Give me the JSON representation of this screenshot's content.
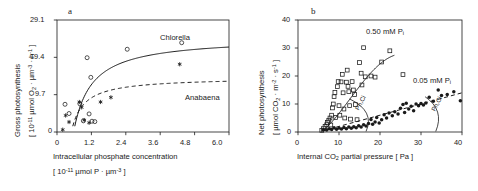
{
  "figure": {
    "background": "#ffffff",
    "ink": "#1a1a1a"
  },
  "panel_a": {
    "letter": "a",
    "xlabel_line1": "Intracellular phosphate concentration",
    "xlabel_line2_pre": "[ 10",
    "xlabel_line2_sup": "-11",
    "xlabel_line2_mid": " µmol P · µm",
    "xlabel_line2_sup2": "-3",
    "xlabel_line2_post": " ]",
    "ylabel_line1": "Gross photosynthesis",
    "ylabel_line2_pre": "[ 10",
    "ylabel_line2_sup": "-11",
    "ylabel_line2_mid": " µmol O",
    "ylabel_line2_sub": "2",
    "ylabel_line2_mid2": " · µm",
    "ylabel_line2_sup2": "-3",
    "ylabel_line2_mid3": " · h",
    "ylabel_line2_sup3": "-1",
    "ylabel_line2_post": " ]",
    "xticks": [
      "0",
      "1.2",
      "2.4",
      "3.6",
      "4.8",
      "6.0"
    ],
    "yticks": [
      "0",
      "9.7",
      "19.4",
      "29.1"
    ],
    "series_labels": {
      "chlorella": "Chlorella",
      "anabaena": "Anabaena"
    }
  },
  "panel_b": {
    "letter": "b",
    "xlabel": "Internal CO",
    "xlabel_sub": "2",
    "xlabel_post": " partial pressure  [ Pa ]",
    "ylabel_line1": "Net  photosynthesis",
    "ylabel_line2_pre": "[ µmol CO",
    "ylabel_line2_sub": "2",
    "ylabel_line2_mid": " · m",
    "ylabel_line2_sup": "-2",
    "ylabel_line2_mid2": " · s",
    "ylabel_line2_sup2": "-1",
    "ylabel_line2_post": " ]",
    "xticks": [
      "0",
      "10",
      "20",
      "30",
      "40"
    ],
    "yticks": [
      "0",
      "10",
      "20",
      "30",
      "40"
    ],
    "curve_labels": {
      "high_pi_pre": "0.50 mM P",
      "high_pi_sub": "i",
      "low_pi_pre": "0.05 mM P",
      "low_pi_sub": "i",
      "pnci_left": "Pn,Ci",
      "pnci_right": "Pn,Ci"
    }
  },
  "chart_data": [
    {
      "type": "scatter",
      "panel": "a",
      "title": "a",
      "xlabel": "Intracellular phosphate concentration [ 10^-11 umol P / um^3 ]",
      "ylabel": "Gross photosynthesis [ 10^-11 umol O2 / um^3 / h ]",
      "xlim": [
        0,
        6.0
      ],
      "ylim": [
        0,
        29.1
      ],
      "xticks": [
        0,
        1.2,
        2.4,
        3.6,
        4.8,
        6.0
      ],
      "yticks": [
        0,
        9.7,
        19.4,
        29.1
      ],
      "grid": false,
      "legend_position": "inline-annotation",
      "series": [
        {
          "name": "Chlorella",
          "marker": "open-circle",
          "line": "solid",
          "points": [
            [
              0.28,
              7.2
            ],
            [
              0.42,
              4.8
            ],
            [
              0.8,
              7.3
            ],
            [
              0.92,
              2.9
            ],
            [
              1.05,
              19.3
            ],
            [
              1.12,
              4.7
            ],
            [
              1.18,
              14.2
            ],
            [
              1.22,
              2.8
            ],
            [
              1.32,
              2.7
            ],
            [
              2.45,
              21.5
            ],
            [
              4.35,
              23.2
            ]
          ],
          "fit_curve": {
            "model": "rectangular-hyperbola-shifted",
            "x_start": 0.62,
            "vmax": 24.6,
            "km": 0.62,
            "x0": 0.58
          }
        },
        {
          "name": "Anabaena",
          "marker": "asterisk",
          "line": "dashed",
          "points": [
            [
              0.2,
              0.6
            ],
            [
              0.3,
              4.3
            ],
            [
              0.42,
              2.6
            ],
            [
              0.78,
              7.8
            ],
            [
              0.86,
              6.4
            ],
            [
              0.95,
              3.1
            ],
            [
              1.12,
              2.4
            ],
            [
              1.52,
              7.8
            ],
            [
              1.88,
              9.0
            ],
            [
              4.28,
              17.6
            ]
          ],
          "fit_curve": {
            "model": "rectangular-hyperbola-shifted",
            "x_start": 0.55,
            "vmax": 14.2,
            "km": 0.42,
            "x0": 0.5
          }
        }
      ]
    },
    {
      "type": "scatter",
      "panel": "b",
      "title": "b",
      "xlabel": "Internal CO2 partial pressure [ Pa ]",
      "ylabel": "Net photosynthesis [ umol CO2 / m^2 / s ]",
      "xlim": [
        0,
        40
      ],
      "ylim": [
        0,
        40
      ],
      "xticks": [
        0,
        10,
        20,
        30,
        40
      ],
      "yticks": [
        0,
        10,
        20,
        30,
        40
      ],
      "grid": false,
      "legend_position": "inline-annotation",
      "annotations": [
        "0.50 mM Pi",
        "0.05 mM Pi",
        "Pn,Ci",
        "Pn,Ci"
      ],
      "series": [
        {
          "name": "0.50 mM Pi",
          "marker": "open-square",
          "line": "solid",
          "points": [
            [
              5.8,
              0.6
            ],
            [
              6.2,
              1.2
            ],
            [
              6.6,
              2.0
            ],
            [
              7.0,
              2.6
            ],
            [
              7.2,
              3.4
            ],
            [
              7.5,
              4.2
            ],
            [
              7.8,
              5.0
            ],
            [
              8.0,
              2.5
            ],
            [
              8.2,
              6.0
            ],
            [
              8.4,
              8.6
            ],
            [
              8.6,
              10.0
            ],
            [
              8.8,
              12.6
            ],
            [
              9.0,
              14.1
            ],
            [
              9.2,
              5.2
            ],
            [
              9.6,
              16.2
            ],
            [
              9.8,
              18.0
            ],
            [
              10.0,
              9.4
            ],
            [
              10.2,
              6.0
            ],
            [
              10.5,
              17.9
            ],
            [
              10.8,
              20.6
            ],
            [
              11.0,
              14.0
            ],
            [
              11.2,
              8.2
            ],
            [
              11.4,
              5.0
            ],
            [
              11.8,
              17.8
            ],
            [
              12.0,
              22.1
            ],
            [
              12.2,
              16.3
            ],
            [
              12.4,
              14.4
            ],
            [
              12.6,
              9.4
            ],
            [
              12.8,
              4.6
            ],
            [
              13.2,
              18.0
            ],
            [
              13.5,
              15.0
            ],
            [
              13.8,
              13.4
            ],
            [
              14.0,
              9.8
            ],
            [
              14.4,
              4.4
            ],
            [
              15.0,
              24.8
            ],
            [
              15.4,
              21.0
            ],
            [
              15.6,
              16.8
            ],
            [
              16.0,
              30.1
            ],
            [
              16.4,
              19.7
            ],
            [
              17.8,
              20.0
            ],
            [
              18.8,
              19.6
            ],
            [
              20.4,
              25.0
            ],
            [
              22.4,
              29.0
            ],
            [
              25.6,
              20.5
            ]
          ],
          "fit_curve": {
            "model": "saturating",
            "x_start": 5.6,
            "x_end": 23.5,
            "vmax": 27.4
          }
        },
        {
          "name": "0.05 mM Pi",
          "marker": "filled-circle",
          "line": "dashed",
          "points": [
            [
              6.2,
              0.8
            ],
            [
              7.0,
              0.7
            ],
            [
              7.6,
              1.2
            ],
            [
              8.2,
              0.9
            ],
            [
              8.8,
              1.5
            ],
            [
              9.4,
              1.0
            ],
            [
              10.0,
              1.4
            ],
            [
              10.6,
              1.1
            ],
            [
              11.2,
              1.6
            ],
            [
              11.8,
              1.2
            ],
            [
              12.4,
              1.8
            ],
            [
              13.0,
              1.3
            ],
            [
              13.6,
              1.9
            ],
            [
              14.2,
              1.5
            ],
            [
              14.8,
              2.2
            ],
            [
              15.4,
              1.8
            ],
            [
              16.0,
              2.6
            ],
            [
              16.6,
              2.1
            ],
            [
              17.2,
              3.0
            ],
            [
              17.8,
              4.5
            ],
            [
              18.2,
              2.8
            ],
            [
              18.8,
              3.6
            ],
            [
              19.2,
              5.2
            ],
            [
              19.8,
              3.2
            ],
            [
              20.4,
              4.4
            ],
            [
              21.0,
              6.2
            ],
            [
              21.6,
              5.0
            ],
            [
              22.2,
              6.8
            ],
            [
              23.0,
              5.8
            ],
            [
              23.6,
              7.2
            ],
            [
              24.4,
              6.4
            ],
            [
              25.0,
              8.5
            ],
            [
              25.6,
              9.8
            ],
            [
              26.0,
              7.0
            ],
            [
              26.4,
              10.3
            ],
            [
              27.0,
              8.2
            ],
            [
              27.6,
              9.2
            ],
            [
              28.2,
              7.6
            ],
            [
              28.8,
              10.0
            ],
            [
              29.4,
              9.4
            ],
            [
              30.0,
              10.2
            ],
            [
              30.6,
              9.6
            ],
            [
              31.2,
              10.4
            ],
            [
              32.0,
              12.4
            ],
            [
              33.0,
              11.0
            ],
            [
              34.2,
              15.0
            ],
            [
              35.0,
              13.0
            ],
            [
              36.4,
              13.4
            ],
            [
              38.0,
              14.4
            ],
            [
              39.6,
              11.2
            ]
          ],
          "fit_curve": {
            "model": "linear",
            "x_start": 6.0,
            "x_end": 40.0,
            "y_start": 0.4,
            "y_end": 14.0
          }
        }
      ]
    }
  ]
}
